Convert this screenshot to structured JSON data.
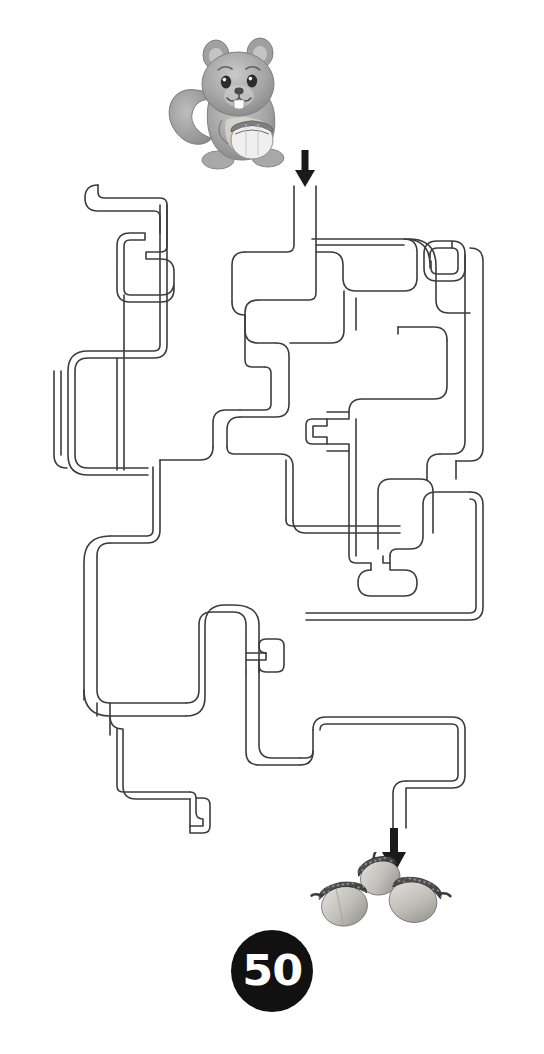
{
  "page": {
    "title": "Squirrel Acorn Maze",
    "background_color": "#ffffff",
    "width": 544,
    "height": 1054
  },
  "badge": {
    "number": "50",
    "shape": "circle",
    "fill_color": "#111111",
    "text_color": "#ffffff"
  },
  "figures": {
    "start_character": {
      "name": "squirrel-illustration",
      "description": "Grey cartoon squirrel holding an acorn",
      "colors": {
        "body": "#9a9a9a",
        "shade": "#7c7c7c",
        "light": "#c8c8c8",
        "acorn_cap": "#6e6e6e"
      }
    },
    "goal_items": {
      "name": "acorn-illustrations",
      "description": "Three acorns at the maze exit",
      "count": 3,
      "colors": {
        "cap": "#4a4a4a",
        "nut": "#b9b9b9",
        "nut_shade": "#8d8d8d"
      }
    }
  },
  "arrows": {
    "entrance": {
      "label": "maze-entrance-arrow",
      "direction": "down",
      "x": 305,
      "y": 150,
      "color": "#1a1a1a"
    },
    "exit": {
      "label": "maze-exit-arrow",
      "direction": "down",
      "x": 394,
      "y": 828,
      "color": "#1a1a1a"
    }
  },
  "maze": {
    "stroke_color": "#3c3c3c",
    "stroke_width": 1.6,
    "corridor_width": 22,
    "corner_radius": 11,
    "entrance_point": [
      305,
      185
    ],
    "exit_point": [
      394,
      830
    ],
    "paths": [
      "M305,185 L305,300 L250,300 L250,258 L430,258 L430,278 L455,278",
      "M305,185 L305,248 L210,248 L210,300",
      "M92,186 L160,186 L160,255 L135,255",
      "M92,186 L92,350 L58,350 L58,470 L140,470 L140,415 L200,415",
      "M200,300 L200,415 L200,500 L255,500 L255,560",
      "M135,415 L135,640 L58,640 L58,780 L205,780",
      "M255,560 L175,560 L175,620 L230,620 L230,700",
      "M300,560 L300,630 L430,630 L430,700",
      "M355,430 L315,430 L315,455 L355,455",
      "M355,430 L355,570 L395,570 L395,600",
      "M430,278 L480,278 L480,520 L455,520 L455,560",
      "M480,520 L480,640 L250,640",
      "M230,700 L130,700 L130,760 L205,760",
      "M205,780 L205,835 L185,835",
      "M330,720 L470,720 L470,790 L394,790 L394,830",
      "M250,780 L330,780 L330,720"
    ]
  }
}
